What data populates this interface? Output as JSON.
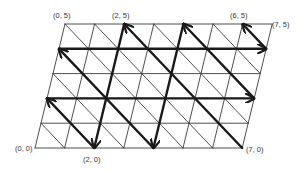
{
  "diagram": {
    "type": "triangular-lattice-path",
    "grid": {
      "cols": 7,
      "rows": 5,
      "diagonal": "top-left-to-bottom-right"
    },
    "geometry": {
      "origin_px": [
        35,
        148
      ],
      "unit_x_px": [
        29.6,
        0
      ],
      "unit_y_px": [
        6.0,
        -24.8
      ]
    },
    "style": {
      "grid_color": "#3a3a3a",
      "grid_width": 0.9,
      "path_color": "#1a1a1a",
      "path_width": 2.4
    },
    "labels": [
      {
        "text": "(0, 0)",
        "x": 15,
        "y": 151,
        "anchor": "start"
      },
      {
        "text": "(2, 0)",
        "x": 83,
        "y": 162,
        "anchor": "start"
      },
      {
        "text": "(7, 0)",
        "x": 246,
        "y": 152,
        "anchor": "start"
      },
      {
        "text": "(0, 5)",
        "x": 53,
        "y": 18,
        "anchor": "start"
      },
      {
        "text": "(2, 5)",
        "x": 112,
        "y": 18,
        "anchor": "start"
      },
      {
        "text": "(6, 5)",
        "x": 230,
        "y": 18,
        "anchor": "start"
      },
      {
        "text": "(7, 5)",
        "x": 272,
        "y": 27,
        "anchor": "start"
      }
    ],
    "arrows": [
      {
        "from": [
          2,
          5
        ],
        "to": [
          2,
          0
        ]
      },
      {
        "from": [
          2,
          0
        ],
        "to": [
          0,
          2
        ]
      },
      {
        "from": [
          0,
          2
        ],
        "to": [
          7,
          2
        ]
      },
      {
        "from": [
          7,
          2
        ],
        "to": [
          4,
          5
        ]
      },
      {
        "from": [
          4,
          5
        ],
        "to": [
          4,
          0
        ]
      },
      {
        "from": [
          4,
          0
        ],
        "to": [
          0,
          4
        ]
      },
      {
        "from": [
          0,
          4
        ],
        "to": [
          7,
          4
        ]
      },
      {
        "from": [
          7,
          4
        ],
        "to": [
          6,
          5
        ]
      },
      {
        "from": [
          7,
          0
        ],
        "to": [
          2,
          5
        ]
      }
    ]
  }
}
